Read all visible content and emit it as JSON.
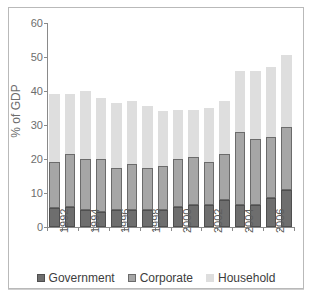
{
  "chart_data": {
    "type": "bar",
    "stacked": true,
    "title": "",
    "subtitle": "",
    "xlabel": "",
    "ylabel": "% of GDP",
    "ylim": [
      0,
      60
    ],
    "yticks": [
      0,
      10,
      20,
      30,
      40,
      50,
      60
    ],
    "grid": false,
    "legend_position": "bottom",
    "categories": [
      "1992",
      "1993",
      "1994",
      "1995",
      "1996",
      "1997",
      "1998",
      "1999",
      "2000",
      "2001",
      "2002",
      "2003",
      "2004",
      "2005",
      "2006",
      "2007"
    ],
    "visible_tick_labels": [
      "1992",
      "1994",
      "1996",
      "1998",
      "2000",
      "2002",
      "2004",
      "2006"
    ],
    "series": [
      {
        "name": "Government",
        "color": "#6e6e6e",
        "values": [
          5.5,
          6.0,
          5.0,
          4.5,
          5.0,
          5.0,
          5.0,
          5.0,
          6.0,
          6.5,
          6.5,
          8.0,
          6.5,
          6.5,
          8.5,
          11.0
        ]
      },
      {
        "name": "Corporate",
        "color": "#a6a6a6",
        "values": [
          13.5,
          15.5,
          15.0,
          15.5,
          12.5,
          13.5,
          12.5,
          13.0,
          14.0,
          14.0,
          12.5,
          13.5,
          21.5,
          19.5,
          18.0,
          18.5
        ]
      },
      {
        "name": "Household",
        "color": "#dedede",
        "values": [
          20.0,
          17.5,
          20.0,
          18.0,
          19.0,
          18.5,
          18.0,
          16.0,
          14.5,
          14.0,
          16.0,
          15.5,
          18.0,
          20.0,
          20.5,
          21.0
        ]
      }
    ],
    "totals": [
      39.0,
      39.0,
      40.0,
      38.0,
      36.5,
      37.0,
      35.5,
      34.0,
      34.5,
      34.5,
      35.0,
      37.0,
      46.0,
      46.0,
      47.0,
      50.5
    ]
  },
  "legend": {
    "items": [
      {
        "label": "Government",
        "swatch": "government"
      },
      {
        "label": "Corporate",
        "swatch": "corporate"
      },
      {
        "label": "Household",
        "swatch": "household"
      }
    ]
  }
}
